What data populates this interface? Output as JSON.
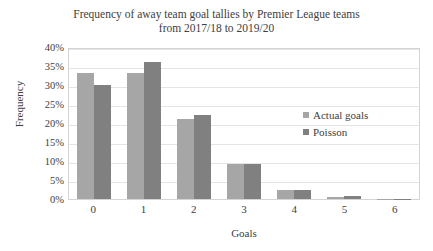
{
  "chart_data": {
    "type": "bar",
    "title": "Frequency of away team goal tallies by Premier League teams\nfrom 2017/18 to 2019/20",
    "xlabel": "Goals",
    "ylabel": "Frequency",
    "categories": [
      "0",
      "1",
      "2",
      "3",
      "4",
      "5",
      "6"
    ],
    "series": [
      {
        "name": "Actual goals",
        "color": "#a6a6a6",
        "values": [
          33.2,
          33.1,
          21.0,
          9.3,
          2.3,
          0.6,
          0.1
        ]
      },
      {
        "name": "Poisson",
        "color": "#808080",
        "values": [
          30.0,
          36.1,
          22.0,
          9.2,
          2.4,
          0.7,
          0.1
        ]
      }
    ],
    "ylim": [
      0,
      40
    ],
    "yticks": [
      "0%",
      "5%",
      "10%",
      "15%",
      "20%",
      "25%",
      "30%",
      "35%",
      "40%"
    ],
    "ytick_values": [
      0,
      5,
      10,
      15,
      20,
      25,
      30,
      35,
      40
    ],
    "grid": true,
    "legend_position": "inside-right"
  }
}
